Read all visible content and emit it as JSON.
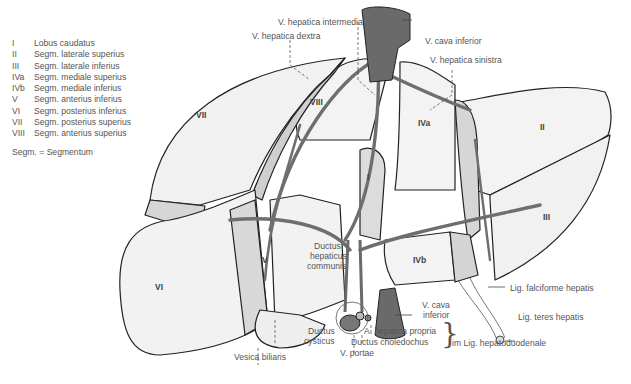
{
  "legend": {
    "items": [
      {
        "num": "I",
        "text": "Lobus caudatus"
      },
      {
        "num": "II",
        "text": "Segm. laterale superius"
      },
      {
        "num": "III",
        "text": "Segm. laterale inferius"
      },
      {
        "num": "IVa",
        "text": "Segm. mediale superius"
      },
      {
        "num": "IVb",
        "text": "Segm. mediale inferius"
      },
      {
        "num": "V",
        "text": "Segm. anterius inferius"
      },
      {
        "num": "VI",
        "text": "Segm. posterius inferius"
      },
      {
        "num": "VII",
        "text": "Segm. posterius superius"
      },
      {
        "num": "VIII",
        "text": "Segm. anterius superius"
      }
    ],
    "note": "Segm. = Segmentum"
  },
  "segments": {
    "I": "I",
    "II": "II",
    "III": "III",
    "IVa": "IVa",
    "IVb": "IVb",
    "V": "V",
    "VI": "VI",
    "VII": "VII",
    "VIII": "VIII"
  },
  "labels": {
    "v_hepatica_intermedia": "V. hepatica intermedia",
    "v_hepatica_dextra": "V. hepatica dextra",
    "v_cava_inferior_top": "V. cava  inferior",
    "v_hepatica_sinistra": "V. hepatica sinistra",
    "ductus_hepaticus_communis_1": "Ductus",
    "ductus_hepaticus_communis_2": "hepaticus",
    "ductus_hepaticus_communis_3": "communis",
    "lig_falciforme": "Lig. falciforme hepatis",
    "lig_teres": "Lig. teres hepatis",
    "v_cava_inferior_bottom_1": "V. cava",
    "v_cava_inferior_bottom_2": "inferior",
    "a_hepatica_propria": "A. hepatica propria",
    "ductus_choledochus": "Ductus choledochus",
    "im_lig": "im Lig. hepatoduodenale",
    "ductus_cysticus_1": "Ductus",
    "ductus_cysticus_2": "cysticus",
    "vesica_biliaris": "Vesica biliaris",
    "v_portae": "V. portae"
  },
  "colors": {
    "liver_light": "#f2f2f2",
    "liver_mid": "#dcdcdc",
    "liver_shadow": "#c9c9c9",
    "vessel": "#6e6e6e",
    "outline": "#222222",
    "text": "#555555"
  }
}
